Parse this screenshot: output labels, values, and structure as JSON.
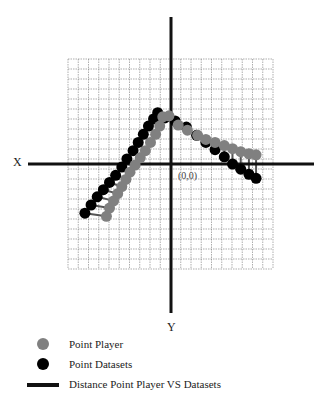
{
  "chart": {
    "x_axis_label": "X",
    "y_axis_label": "Y",
    "origin_label": "(0,0)"
  },
  "legend": {
    "items": [
      {
        "label": "Point Player",
        "symbol": "gray-circle",
        "color": "#808080"
      },
      {
        "label": "Point Datasets",
        "symbol": "black-circle",
        "color": "#000000"
      },
      {
        "label": "Distance Point Player VS Datasets",
        "symbol": "black-line",
        "color": "#111111"
      }
    ]
  },
  "chart_data": {
    "type": "scatter",
    "title": "",
    "xlabel": "X",
    "ylabel": "Y",
    "xlim": [
      -10,
      10
    ],
    "ylim": [
      -10.5,
      10.5
    ],
    "grid": true,
    "legend_position": "bottom",
    "annotations": [
      "(0,0)"
    ],
    "series": [
      {
        "name": "Point Datasets",
        "color": "#000000",
        "points": [
          [
            -8.4,
            -4.8
          ],
          [
            -7.8,
            -4.0
          ],
          [
            -7.2,
            -3.2
          ],
          [
            -6.6,
            -2.5
          ],
          [
            -6.0,
            -1.8
          ],
          [
            -5.4,
            -1.1
          ],
          [
            -4.8,
            -0.3
          ],
          [
            -4.3,
            0.5
          ],
          [
            -3.7,
            1.3
          ],
          [
            -3.2,
            2.1
          ],
          [
            -2.7,
            2.9
          ],
          [
            -2.2,
            3.7
          ],
          [
            -1.7,
            4.4
          ],
          [
            -1.3,
            5.0
          ],
          [
            -0.6,
            4.5
          ],
          [
            0.4,
            4.2
          ],
          [
            1.5,
            3.6
          ],
          [
            2.5,
            2.8
          ],
          [
            3.4,
            2.1
          ],
          [
            4.3,
            1.4
          ],
          [
            5.2,
            0.7
          ],
          [
            6.0,
            0.0
          ],
          [
            6.8,
            -0.5
          ],
          [
            7.6,
            -1.0
          ],
          [
            8.3,
            -1.4
          ]
        ]
      },
      {
        "name": "Point Player",
        "color": "#808080",
        "points": [
          [
            -6.3,
            -5.1
          ],
          [
            -6.0,
            -4.3
          ],
          [
            -5.6,
            -3.6
          ],
          [
            -5.2,
            -2.9
          ],
          [
            -4.8,
            -2.2
          ],
          [
            -4.4,
            -1.5
          ],
          [
            -4.0,
            -0.8
          ],
          [
            -3.5,
            -0.1
          ],
          [
            -3.0,
            0.6
          ],
          [
            -2.5,
            1.3
          ],
          [
            -2.0,
            2.1
          ],
          [
            -1.5,
            2.9
          ],
          [
            -1.1,
            3.7
          ],
          [
            -0.8,
            4.6
          ],
          [
            -0.2,
            4.7
          ],
          [
            0.7,
            3.8
          ],
          [
            1.6,
            3.3
          ],
          [
            2.6,
            2.8
          ],
          [
            3.4,
            2.4
          ],
          [
            4.3,
            2.1
          ],
          [
            5.2,
            1.8
          ],
          [
            6.0,
            1.5
          ],
          [
            6.8,
            1.2
          ],
          [
            7.6,
            1.0
          ],
          [
            8.3,
            0.9
          ]
        ]
      }
    ],
    "distance_lines": "vertical connectors between each Point Player and its corresponding Point Datasets"
  }
}
